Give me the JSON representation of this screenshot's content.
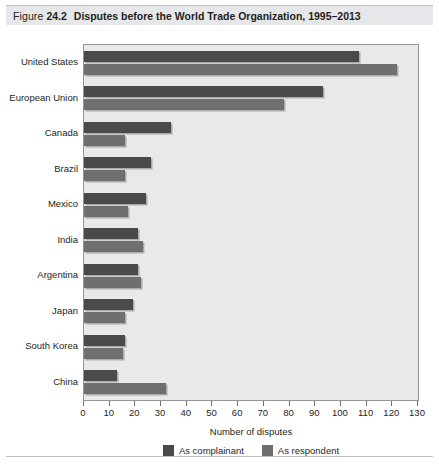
{
  "figure": {
    "label": "Figure",
    "number": "24.2",
    "title": "Disputes before the World Trade Organization, 1995–2013"
  },
  "chart_data": {
    "type": "bar",
    "orientation": "horizontal",
    "title": "Disputes before the World Trade Organization, 1995–2013",
    "xlabel": "Number of disputes",
    "ylabel": "",
    "xlim": [
      0,
      130
    ],
    "xticks": [
      0,
      10,
      20,
      30,
      40,
      50,
      60,
      70,
      80,
      90,
      100,
      110,
      120,
      130
    ],
    "grid": false,
    "legend_position": "bottom-center",
    "categories": [
      "United States",
      "European Union",
      "Canada",
      "Brazil",
      "Mexico",
      "India",
      "Argentina",
      "Japan",
      "South Korea",
      "China"
    ],
    "series": [
      {
        "name": "As complainant",
        "color": "#4a4a4a",
        "values": [
          107,
          93,
          34,
          26,
          24,
          21,
          21,
          19,
          16,
          13
        ]
      },
      {
        "name": "As respondent",
        "color": "#6f6f6f",
        "values": [
          122,
          78,
          16,
          16,
          17,
          23,
          22,
          16,
          15,
          32
        ]
      }
    ]
  },
  "plot_background_color": "#e9e9e9",
  "frame_color": "#939598"
}
